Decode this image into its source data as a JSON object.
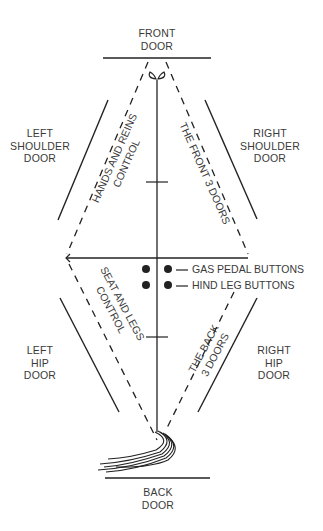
{
  "doors": {
    "front": [
      "FRONT",
      "DOOR"
    ],
    "back": [
      "BACK",
      "DOOR"
    ],
    "left_shoulder": [
      "LEFT",
      "SHOULDER",
      "DOOR"
    ],
    "right_shoulder": [
      "RIGHT",
      "SHOULDER",
      "DOOR"
    ],
    "left_hip": [
      "LEFT",
      "HIP",
      "DOOR"
    ],
    "right_hip": [
      "RIGHT",
      "HIP",
      "DOOR"
    ]
  },
  "zones": {
    "hands_reins": [
      "HANDS AND REINS",
      "CONTROL"
    ],
    "front_doors": "THE FRONT 3 DOORS",
    "seat_legs": [
      "SEAT AND LEGS",
      "CONTROL"
    ],
    "back_doors": [
      "THE BACK",
      "3 DOORS"
    ]
  },
  "buttons": {
    "gas_pedal": "GAS PEDAL BUTTONS",
    "hind_leg": "HIND LEG BUTTONS"
  },
  "colors": {
    "line": "#222222",
    "text": "#3a3a3a",
    "background": "#ffffff"
  }
}
